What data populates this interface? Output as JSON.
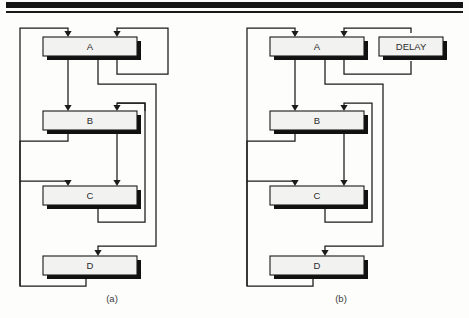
{
  "figure": {
    "width": 469,
    "height": 318,
    "background": "#fdfdfc",
    "ink": "#1b1b1b",
    "node_fill": "#f2f2f0",
    "shadow": "#111111",
    "top_rule": {
      "thick_y": 2,
      "thick_h": 6,
      "thin_y": 11,
      "thin_h": 2,
      "x": 6,
      "w": 457
    }
  },
  "panels": [
    {
      "id": "panel-a",
      "caption": "(a)",
      "caption_x": 112,
      "caption_y": 302,
      "nodes": [
        {
          "id": "a-node-a",
          "label": "A",
          "x": 43,
          "y": 37,
          "w": 94,
          "h": 19
        },
        {
          "id": "a-node-b",
          "label": "B",
          "x": 43,
          "y": 111,
          "w": 94,
          "h": 19
        },
        {
          "id": "a-node-c",
          "label": "C",
          "x": 43,
          "y": 186,
          "w": 94,
          "h": 19
        },
        {
          "id": "a-node-d",
          "label": "D",
          "x": 43,
          "y": 256,
          "w": 94,
          "h": 19
        }
      ],
      "wires": [
        {
          "id": "a-wire-d-to-a-in",
          "d": "M 86 279 L 86 286 L 20 286 L 20 28 L 68 28 L 68 33"
        },
        {
          "id": "a-wire-a-to-b",
          "d": "M 68 60 L 68 106"
        },
        {
          "id": "a-wire-b-to-c",
          "d": "M 68 134 L 68 141 L 20 141 L 20 181 L 68 181 L 68 181"
        },
        {
          "id": "a-wire-a-self-loop",
          "d": "M 117 60 L 117 74 L 168 74 L 168 28 L 117 28 L 117 33"
        },
        {
          "id": "a-wire-a-to-d-long",
          "d": "M 98 60 L 98 84 L 156 84 L 156 246 L 98 246 L 98 251"
        },
        {
          "id": "a-wire-b-down",
          "d": "M 117 134 L 117 181"
        },
        {
          "id": "a-wire-b-side",
          "d": "M 145 111 L 145 103 L 117 103 L 117 103"
        },
        {
          "id": "a-wire-c-loop",
          "d": "M 98 209 L 98 222 L 145 222 L 145 103 L 117 103 L 117 106"
        },
        {
          "id": "a-wire-c-to-d-edge",
          "d": "M 20 181 L 20 286"
        }
      ],
      "arrows": [
        {
          "id": "a-arrow-into-a-left",
          "x": 68,
          "y": 37
        },
        {
          "id": "a-arrow-into-a-right",
          "x": 117,
          "y": 37
        },
        {
          "id": "a-arrow-into-b-left",
          "x": 68,
          "y": 111
        },
        {
          "id": "a-arrow-into-b-right",
          "x": 117,
          "y": 111
        },
        {
          "id": "a-arrow-into-c-left",
          "x": 68,
          "y": 186
        },
        {
          "id": "a-arrow-into-c-right",
          "x": 117,
          "y": 186
        },
        {
          "id": "a-arrow-into-d",
          "x": 98,
          "y": 256
        }
      ]
    },
    {
      "id": "panel-b",
      "caption": "(b)",
      "caption_x": 341,
      "caption_y": 302,
      "nodes": [
        {
          "id": "b-node-a",
          "label": "A",
          "x": 270,
          "y": 37,
          "w": 94,
          "h": 19
        },
        {
          "id": "b-node-delay",
          "label": "DELAY",
          "x": 379,
          "y": 37,
          "w": 64,
          "h": 19
        },
        {
          "id": "b-node-b",
          "label": "B",
          "x": 270,
          "y": 111,
          "w": 94,
          "h": 19
        },
        {
          "id": "b-node-c",
          "label": "C",
          "x": 270,
          "y": 186,
          "w": 94,
          "h": 19
        },
        {
          "id": "b-node-d",
          "label": "D",
          "x": 270,
          "y": 256,
          "w": 94,
          "h": 19
        }
      ],
      "wires": [
        {
          "id": "b-wire-d-to-a-in",
          "d": "M 313 279 L 313 286 L 247 286 L 247 28 L 295 28 L 295 33"
        },
        {
          "id": "b-wire-a-to-b",
          "d": "M 295 60 L 295 106"
        },
        {
          "id": "b-wire-a-to-delay",
          "d": "M 344 60 L 344 74 L 411 74 L 411 61"
        },
        {
          "id": "b-wire-delay-to-a",
          "d": "M 411 33 L 411 28 L 344 28 L 344 33"
        },
        {
          "id": "b-wire-a-to-d-long",
          "d": "M 325 60 L 325 84 L 383 84 L 383 246 L 325 246 L 325 251"
        },
        {
          "id": "b-wire-b-down",
          "d": "M 344 134 L 344 181"
        },
        {
          "id": "b-wire-c-loop",
          "d": "M 325 209 L 325 222 L 372 222 L 372 103 L 344 103 L 344 106"
        },
        {
          "id": "b-wire-b-to-c-left",
          "d": "M 295 134 L 295 141 L 247 141 L 247 181 L 295 181"
        },
        {
          "id": "b-wire-left-rail",
          "d": "M 247 181 L 247 286"
        }
      ],
      "arrows": [
        {
          "id": "b-arrow-into-a-left",
          "x": 295,
          "y": 37
        },
        {
          "id": "b-arrow-into-a-right",
          "x": 344,
          "y": 37
        },
        {
          "id": "b-arrow-into-delay",
          "x": 411,
          "y": 60
        },
        {
          "id": "b-arrow-into-b-left",
          "x": 295,
          "y": 111
        },
        {
          "id": "b-arrow-into-b-right",
          "x": 344,
          "y": 111
        },
        {
          "id": "b-arrow-into-c-left",
          "x": 295,
          "y": 186
        },
        {
          "id": "b-arrow-into-c-right",
          "x": 344,
          "y": 186
        },
        {
          "id": "b-arrow-into-d",
          "x": 325,
          "y": 256
        }
      ]
    }
  ]
}
